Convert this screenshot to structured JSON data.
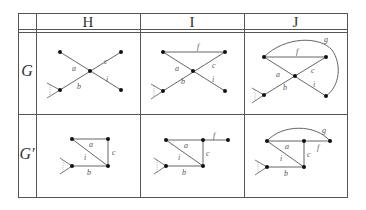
{
  "table": {
    "column_headers": [
      "H",
      "I",
      "J"
    ],
    "row_labels": [
      "G",
      "G′"
    ]
  },
  "graphs": {
    "H_G": {
      "edges": [
        {
          "label": "a",
          "from": "TL",
          "to": "C"
        },
        {
          "label": "b",
          "from": "BL",
          "to": "C"
        },
        {
          "label": "c",
          "from": "C",
          "to": "TR"
        },
        {
          "label": "i",
          "from": "C",
          "to": "BR"
        }
      ],
      "wedge_at": "BL"
    },
    "I_G": {
      "edges": [
        {
          "label": "f",
          "from": "TL",
          "to": "TR"
        },
        {
          "label": "a",
          "from": "TL",
          "to": "C"
        },
        {
          "label": "b",
          "from": "BL",
          "to": "C"
        },
        {
          "label": "c",
          "from": "C",
          "to": "TR"
        },
        {
          "label": "i",
          "from": "C",
          "to": "BR"
        }
      ],
      "wedge_at": "BL"
    },
    "J_G": {
      "edges": [
        {
          "label": "f",
          "from": "TL",
          "to": "TR"
        },
        {
          "label": "g",
          "from": "TL",
          "to": "BR",
          "curved": true
        },
        {
          "label": "a",
          "from": "TL",
          "to": "C"
        },
        {
          "label": "b",
          "from": "BL",
          "to": "C"
        },
        {
          "label": "c",
          "from": "C",
          "to": "TR"
        },
        {
          "label": "i",
          "from": "C",
          "to": "BR"
        }
      ],
      "wedge_at": "BL"
    },
    "H_Gp": {
      "edges": [
        {
          "label": "a",
          "from": "TL",
          "to": "TR"
        },
        {
          "label": "c",
          "from": "TR",
          "to": "BR"
        },
        {
          "label": "i",
          "from": "TL",
          "to": "BR"
        },
        {
          "label": "b",
          "from": "BL",
          "to": "BR"
        }
      ],
      "wedge_at": "BL"
    },
    "I_Gp": {
      "edges": [
        {
          "label": "a",
          "from": "TL",
          "to": "TR"
        },
        {
          "label": "f",
          "from": "TR",
          "to": "R"
        },
        {
          "label": "c",
          "from": "TR",
          "to": "BR"
        },
        {
          "label": "i",
          "from": "TL",
          "to": "BR"
        },
        {
          "label": "b",
          "from": "BL",
          "to": "BR"
        }
      ],
      "wedge_at": "BL"
    },
    "J_Gp": {
      "edges": [
        {
          "label": "a",
          "from": "TL",
          "to": "TR"
        },
        {
          "label": "f",
          "from": "TR",
          "to": "R"
        },
        {
          "label": "g",
          "from": "TL",
          "to": "R",
          "curved": true
        },
        {
          "label": "c",
          "from": "TR",
          "to": "BR"
        },
        {
          "label": "i",
          "from": "TL",
          "to": "BR"
        },
        {
          "label": "b",
          "from": "BL",
          "to": "BR"
        }
      ],
      "wedge_at": "BL"
    }
  },
  "labels": {
    "a": "a",
    "b": "b",
    "c": "c",
    "f": "f",
    "g": "g",
    "i": "i"
  }
}
